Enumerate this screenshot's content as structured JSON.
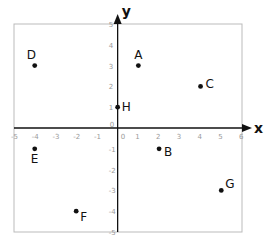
{
  "chart_data": {
    "type": "scatter",
    "title": "",
    "xlabel": "x",
    "ylabel": "y",
    "xlim": [
      -5,
      6
    ],
    "ylim": [
      -5,
      5
    ],
    "grid": false,
    "x_ticks": [
      -5,
      -4,
      -3,
      -2,
      -1,
      0,
      1,
      2,
      3,
      4,
      5,
      6
    ],
    "y_ticks": [
      -5,
      -4,
      -3,
      -2,
      -1,
      0,
      1,
      2,
      3,
      4,
      5
    ],
    "points": [
      {
        "label": "A",
        "x": 1,
        "y": 3
      },
      {
        "label": "B",
        "x": 2,
        "y": -1
      },
      {
        "label": "C",
        "x": 4,
        "y": 2
      },
      {
        "label": "D",
        "x": -4,
        "y": 3
      },
      {
        "label": "E",
        "x": -4,
        "y": -1
      },
      {
        "label": "F",
        "x": -2,
        "y": -4
      },
      {
        "label": "G",
        "x": 5,
        "y": -3
      },
      {
        "label": "H",
        "x": 0,
        "y": 1
      }
    ],
    "colors": {
      "axis": "#111111",
      "frame": "#bbbbbb",
      "tick": "#9a9a9a",
      "point": "#111111"
    }
  }
}
